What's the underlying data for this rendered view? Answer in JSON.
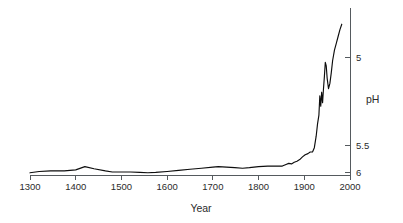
{
  "chart_data": {
    "type": "line",
    "title": "",
    "subtitle": "",
    "xlabel": "Year",
    "ylabel": "pH",
    "xlim": [
      1300,
      2000
    ],
    "ylim": [
      6.15,
      4.72
    ],
    "y_inverted": true,
    "grid": false,
    "legend": null,
    "annotations": [],
    "xticks": [
      1300,
      1400,
      1500,
      1600,
      1700,
      1800,
      1900,
      2000
    ],
    "xtick_labels": [
      "1300",
      "1400",
      "1500",
      "1600",
      "1700",
      "1800",
      "1900",
      "2000"
    ],
    "yticks": [
      5,
      5.5,
      6
    ],
    "ytick_labels": [
      "5",
      "5.5",
      "6"
    ],
    "series": [
      {
        "name": "pH",
        "x": [
          1300,
          1320,
          1345,
          1375,
          1400,
          1420,
          1440,
          1465,
          1480,
          1500,
          1520,
          1540,
          1558,
          1575,
          1600,
          1625,
          1650,
          1675,
          1700,
          1712,
          1730,
          1748,
          1765,
          1780,
          1800,
          1820,
          1838,
          1852,
          1860,
          1866,
          1872,
          1878,
          1884,
          1890,
          1896,
          1902,
          1908,
          1913,
          1918,
          1922,
          1926,
          1929,
          1932,
          1934,
          1936,
          1938,
          1940,
          1942,
          1944,
          1946,
          1948,
          1950,
          1953,
          1956,
          1959,
          1962,
          1966,
          1970,
          1974,
          1978,
          1982
        ],
        "y": [
          6.02,
          5.99,
          5.98,
          5.98,
          5.96,
          5.9,
          5.94,
          5.98,
          6.0,
          6.0,
          6.0,
          6.01,
          6.02,
          6.01,
          5.99,
          5.97,
          5.95,
          5.93,
          5.91,
          5.9,
          5.91,
          5.92,
          5.93,
          5.92,
          5.9,
          5.89,
          5.89,
          5.89,
          5.86,
          5.84,
          5.85,
          5.82,
          5.8,
          5.77,
          5.72,
          5.68,
          5.66,
          5.63,
          5.63,
          5.55,
          5.45,
          5.38,
          5.33,
          5.22,
          5.28,
          5.2,
          5.26,
          5.18,
          5.11,
          5.03,
          5.05,
          5.12,
          5.18,
          5.15,
          5.09,
          5.02,
          4.95,
          4.9,
          4.85,
          4.8,
          4.76
        ]
      }
    ]
  },
  "labels": {
    "x_axis_title": "Year",
    "y_axis_title": "pH"
  }
}
